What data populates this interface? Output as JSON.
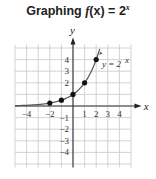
{
  "title": {
    "prefix": "Graphing ",
    "func": "f",
    "arg": "(x)",
    "eq": " = 2",
    "exp": "x"
  },
  "chart_data": {
    "type": "line",
    "xlabel": "x",
    "ylabel": "y",
    "xlim": [
      -5,
      5
    ],
    "ylim": [
      -5,
      5
    ],
    "grid": true,
    "x_ticks": [
      "-4",
      "-2",
      "1",
      "2",
      "3",
      "4"
    ],
    "y_ticks": [
      "4",
      "3",
      "2",
      "-1",
      "-2",
      "-3",
      "-4"
    ],
    "series": [
      {
        "name": "y = 2^x",
        "x": [
          -2,
          -1,
          0,
          1,
          2
        ],
        "y": [
          0.25,
          0.5,
          1,
          2,
          4
        ]
      }
    ],
    "annotation": "y = 2^x",
    "color": "#555555",
    "point_color": "#111111",
    "grid_color": "#c8c8c8"
  }
}
